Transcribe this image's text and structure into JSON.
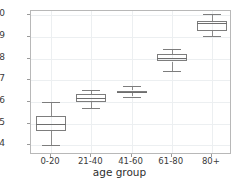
{
  "chart_data": {
    "type": "box",
    "title": "",
    "xlabel": "age group",
    "ylabel": "",
    "categories": [
      "0-20",
      "21-40",
      "41-60",
      "61-80",
      "80+"
    ],
    "ylim": [
      0.355,
      1.02
    ],
    "yticks": [
      0.4,
      0.5,
      0.6,
      0.7,
      0.8,
      0.9,
      1.0
    ],
    "ytick_labels": [
      "0.4",
      "0.5",
      "0.6",
      "0.7",
      "0.8",
      "0.9",
      "1.0"
    ],
    "grid": true,
    "legend": "none",
    "boxes": [
      {
        "category": "0-20",
        "whisker_low": 0.4,
        "q1": 0.465,
        "median": 0.5,
        "q3": 0.535,
        "whisker_high": 0.6
      },
      {
        "category": "21-40",
        "whisker_low": 0.572,
        "q1": 0.6,
        "median": 0.617,
        "q3": 0.635,
        "whisker_high": 0.655
      },
      {
        "category": "41-60",
        "whisker_low": 0.625,
        "q1": 0.64,
        "median": 0.648,
        "q3": 0.653,
        "whisker_high": 0.672
      },
      {
        "category": "61-80",
        "whisker_low": 0.745,
        "q1": 0.787,
        "median": 0.805,
        "q3": 0.822,
        "whisker_high": 0.843
      },
      {
        "category": "80+",
        "whisker_low": 0.905,
        "q1": 0.928,
        "median": 0.965,
        "q3": 0.972,
        "whisker_high": 1.005
      }
    ],
    "colors": {
      "box_edge": "#7d7d7d",
      "median": "#6e6e6e",
      "whisker": "#8c8c8c",
      "grid": "#eceff1",
      "frame": "#b8b8b8",
      "text": "#3a3a3a",
      "background": "#ffffff"
    }
  }
}
